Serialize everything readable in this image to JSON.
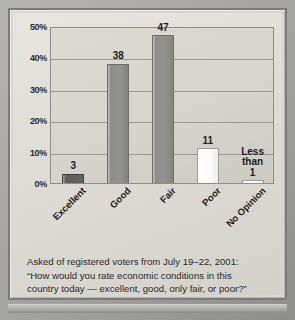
{
  "chart_data": {
    "type": "bar",
    "title": "",
    "xlabel": "",
    "ylabel": "",
    "ylim": [
      0,
      50
    ],
    "grid": true,
    "legend": "none",
    "categories": [
      "Excellent",
      "Good",
      "Fair",
      "Poor",
      "No Opinion"
    ],
    "values": [
      3,
      38,
      47,
      11,
      0.5
    ],
    "value_labels": [
      "3",
      "38",
      "47",
      "11",
      "Less\nthan\n1"
    ],
    "bar_styles": [
      "dark",
      "mid",
      "mid",
      "light",
      "light"
    ],
    "ytick_labels": [
      "0%",
      "10%",
      "20%",
      "30%",
      "40%",
      "50%"
    ],
    "ytick_values": [
      0,
      10,
      20,
      30,
      40,
      50
    ]
  },
  "bars": [
    {
      "category": "Excellent",
      "value": 3,
      "label": "3",
      "style": "dark",
      "multiline": false
    },
    {
      "category": "Good",
      "value": 38,
      "label": "38",
      "style": "mid",
      "multiline": false
    },
    {
      "category": "Fair",
      "value": 47,
      "label": "47",
      "style": "mid",
      "multiline": false
    },
    {
      "category": "Poor",
      "value": 11,
      "label": "11",
      "style": "light",
      "multiline": false
    },
    {
      "category": "No Opinion",
      "value": 0.5,
      "label": "Less|than|1",
      "style": "light",
      "multiline": true
    }
  ],
  "caption": {
    "line1": "Asked of registered voters from July 19–22, 2001:",
    "line2": "“How would you rate economic conditions in this",
    "line3": "country today — excellent, good, only fair, or poor?”"
  },
  "colors": {
    "bar_dark": "#5e5e5c",
    "bar_mid": "#8d8d8a",
    "bar_light": "#ffffff",
    "plot_background": "#d4d3cc",
    "paper": "#dedcd5",
    "frame": "#a2a2a0",
    "gridline": "#9a9a96",
    "text": "#1d1d1d"
  }
}
